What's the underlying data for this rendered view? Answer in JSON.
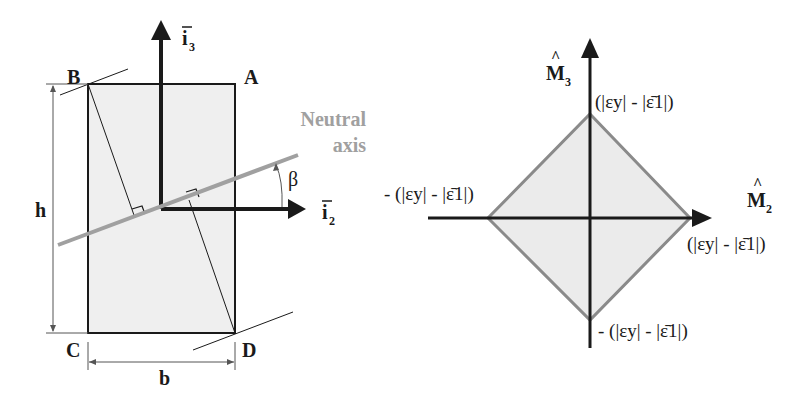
{
  "left_diagram": {
    "corners": {
      "A": "A",
      "B": "B",
      "C": "C",
      "D": "D"
    },
    "dimension_height": "h",
    "dimension_width": "b",
    "axis_vertical": {
      "base": "i",
      "subscript": "3",
      "bar": "‾"
    },
    "axis_horizontal": {
      "base": "i",
      "subscript": "2",
      "bar": "‾"
    },
    "neutral_axis_label_line1": "Neutral",
    "neutral_axis_label_line2": "axis",
    "angle_label": "β",
    "colors": {
      "section_fill": "#efefef",
      "outline": "#1a1a1a",
      "neutral_axis": "#a0a0a0"
    }
  },
  "right_diagram": {
    "axis_vertical": {
      "base": "M",
      "subscript": "3",
      "hat": "^"
    },
    "axis_horizontal": {
      "base": "M",
      "subscript": "2",
      "hat": "^"
    },
    "vertex_labels": {
      "top": "(|εy| - |ε̄1|)",
      "right": "(|εy| - |ε̄1|)",
      "left": "- (|εy| - |ε̄1|)",
      "bottom": "- (|εy| - |ε̄1|)"
    },
    "colors": {
      "diamond_fill": "#ebebeb",
      "diamond_stroke": "#8a8a8a",
      "axes": "#1a1a1a"
    }
  }
}
